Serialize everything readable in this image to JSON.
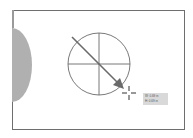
{
  "artboard": {
    "border_color": "#6e6e6e",
    "background": "#ffffff"
  },
  "shapes": {
    "side_shape_color": "#b0b0b0",
    "circle_stroke": "#6a6a6a",
    "arrow_color": "#6a6a6a"
  },
  "cursor": {
    "icon": "crosshair-icon"
  },
  "tooltip": {
    "width_label": "W: 0.69 in",
    "height_label": "H: 0.69 in"
  }
}
